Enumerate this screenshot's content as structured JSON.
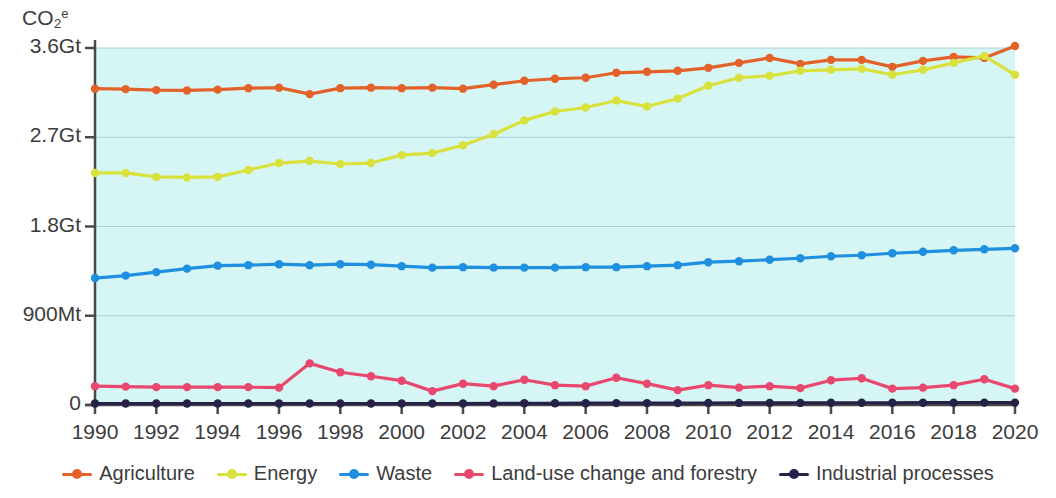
{
  "chart_data": {
    "type": "line",
    "title": "",
    "xlabel": "",
    "ylabel": "CO2e",
    "ylabel_parts": {
      "base": "CO",
      "sub": "2",
      "sup": "e"
    },
    "grid": true,
    "legend_position": "bottom",
    "plot_background": "#d6f5f5",
    "xlim": [
      1990,
      2020
    ],
    "ylim": [
      0,
      3600
    ],
    "y_unit_note": "values in Mt CO2e; 900Mt = 0.9Gt",
    "yticks": [
      0,
      900,
      1800,
      2700,
      3600
    ],
    "ytick_labels": [
      "0",
      "900Mt",
      "1.8Gt",
      "2.7Gt",
      "3.6Gt"
    ],
    "x": [
      1990,
      1991,
      1992,
      1993,
      1994,
      1995,
      1996,
      1997,
      1998,
      1999,
      2000,
      2001,
      2002,
      2003,
      2004,
      2005,
      2006,
      2007,
      2008,
      2009,
      2010,
      2011,
      2012,
      2013,
      2014,
      2015,
      2016,
      2017,
      2018,
      2019,
      2020
    ],
    "xtick_labels": [
      "1990",
      "1992",
      "1994",
      "1996",
      "1998",
      "2000",
      "2002",
      "2004",
      "2006",
      "2008",
      "2010",
      "2012",
      "2014",
      "2016",
      "2018",
      "2020"
    ],
    "xticks": [
      1990,
      1992,
      1994,
      1996,
      1998,
      2000,
      2002,
      2004,
      2006,
      2008,
      2010,
      2012,
      2014,
      2016,
      2018,
      2020
    ],
    "series": [
      {
        "name": "Agriculture",
        "color": "#e2622a",
        "values": [
          3190,
          3185,
          3175,
          3172,
          3180,
          3195,
          3200,
          3135,
          3195,
          3200,
          3195,
          3200,
          3190,
          3230,
          3270,
          3290,
          3300,
          3350,
          3360,
          3370,
          3400,
          3450,
          3500,
          3440,
          3480,
          3480,
          3410,
          3470,
          3510,
          3500,
          3620
        ]
      },
      {
        "name": "Energy",
        "color": "#d9e23c",
        "values": [
          2340,
          2340,
          2300,
          2295,
          2300,
          2370,
          2440,
          2460,
          2430,
          2440,
          2520,
          2540,
          2620,
          2730,
          2870,
          2960,
          3000,
          3070,
          3010,
          3090,
          3220,
          3300,
          3320,
          3370,
          3380,
          3390,
          3330,
          3380,
          3450,
          3520,
          3330
        ]
      },
      {
        "name": "Waste",
        "color": "#1f8fe0",
        "values": [
          1280,
          1305,
          1340,
          1375,
          1405,
          1410,
          1420,
          1410,
          1420,
          1415,
          1400,
          1385,
          1390,
          1385,
          1385,
          1385,
          1390,
          1390,
          1400,
          1410,
          1440,
          1450,
          1465,
          1480,
          1500,
          1510,
          1530,
          1545,
          1560,
          1570,
          1580
        ]
      },
      {
        "name": "Land-use change and forestry",
        "color": "#e8486e",
        "values": [
          190,
          185,
          180,
          180,
          180,
          180,
          175,
          420,
          330,
          290,
          245,
          140,
          215,
          190,
          255,
          200,
          190,
          275,
          215,
          150,
          200,
          175,
          190,
          170,
          250,
          270,
          165,
          175,
          200,
          260,
          165
        ]
      },
      {
        "name": "Industrial processes",
        "color": "#262147",
        "values": [
          15,
          15,
          15,
          15,
          15,
          15,
          15,
          15,
          15,
          15,
          15,
          15,
          15,
          16,
          17,
          17,
          18,
          19,
          19,
          19,
          20,
          21,
          21,
          21,
          22,
          22,
          22,
          23,
          23,
          24,
          24
        ]
      }
    ]
  },
  "legend": [
    {
      "label": "Agriculture",
      "color": "#e2622a"
    },
    {
      "label": "Energy",
      "color": "#d9e23c"
    },
    {
      "label": "Waste",
      "color": "#1f8fe0"
    },
    {
      "label": "Land-use change and forestry",
      "color": "#e8486e"
    },
    {
      "label": "Industrial processes",
      "color": "#262147"
    }
  ]
}
